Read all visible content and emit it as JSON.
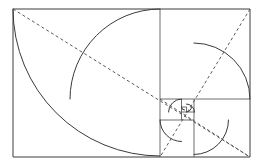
{
  "figure": {
    "title": "Golden Ratio Fibonacci Spiral Diagram",
    "kind": "geometric-line-drawing",
    "canvas": {
      "width": 262,
      "height": 166,
      "background": "#ffffff"
    },
    "colors": {
      "outline": "#3c3c3c",
      "subdivision": "#4a4a4a",
      "spiral": "#3a3a3a",
      "diagonal_dashed": "#5a5a5a"
    },
    "outer_rectangle": {
      "name": "golden-rectangle",
      "x": 13,
      "y": 9,
      "width": 237,
      "height": 148,
      "ratio_label": "1.618"
    },
    "squares": [
      {
        "index": 1,
        "x": 13,
        "y": 9,
        "size": 147.0,
        "corner": "top-left"
      },
      {
        "index": 2,
        "x": 160,
        "y": 9,
        "size": 90.0,
        "corner": "top-right"
      },
      {
        "index": 3,
        "x": 194,
        "y": 99,
        "size": 56.0,
        "corner": "bottom-right"
      },
      {
        "index": 4,
        "x": 160,
        "y": 120,
        "size": 34.5,
        "corner": "bottom-left"
      },
      {
        "index": 5,
        "x": 160,
        "y": 99,
        "size": 21.5,
        "corner": "top-left"
      },
      {
        "index": 6,
        "x": 181.5,
        "y": 99,
        "size": 13.0,
        "corner": "top-right"
      },
      {
        "index": 7,
        "x": 186.5,
        "y": 112,
        "size": 8.0,
        "corner": "bottom-right"
      },
      {
        "index": 8,
        "x": 181.5,
        "y": 107,
        "size": 5.0,
        "corner": "bottom-left"
      },
      {
        "index": 9,
        "x": 181.5,
        "y": 104,
        "size": 3.0,
        "corner": "top-left"
      }
    ],
    "subdivision_lines": [
      {
        "name": "vertical-split-main",
        "x1": 160,
        "y1": 9,
        "x2": 160,
        "y2": 157
      },
      {
        "name": "horizontal-split-right",
        "x1": 160,
        "y1": 99,
        "x2": 250,
        "y2": 99
      },
      {
        "name": "vertical-split-lower",
        "x1": 194,
        "y1": 99,
        "x2": 194,
        "y2": 157
      },
      {
        "name": "horizontal-split-small",
        "x1": 160,
        "y1": 120,
        "x2": 194,
        "y2": 120
      },
      {
        "name": "vertical-split-tiny",
        "x1": 181.5,
        "y1": 99,
        "x2": 181.5,
        "y2": 120
      },
      {
        "name": "horizontal-split-tiny",
        "x1": 181.5,
        "y1": 112,
        "x2": 194.5,
        "y2": 112
      },
      {
        "name": "vertical-split-micro",
        "x1": 186.5,
        "y1": 107,
        "x2": 186.5,
        "y2": 112
      },
      {
        "name": "horizontal-split-micro",
        "x1": 181.5,
        "y1": 107,
        "x2": 186.5,
        "y2": 107
      }
    ],
    "spiral_arcs": [
      {
        "index": 1,
        "center_x": 160,
        "center_y": 9,
        "radius": 147.0,
        "from": "bottom-left-of-square-1",
        "to": "top-left"
      },
      {
        "index": 2,
        "center_x": 160,
        "center_y": 99,
        "radius": 90.0,
        "from": "top-right",
        "to": "right"
      },
      {
        "index": 3,
        "center_x": 194,
        "center_y": 99,
        "radius": 56.0,
        "from": "bottom-right",
        "to": "bottom"
      },
      {
        "index": 4,
        "center_x": 194,
        "center_y": 120,
        "radius": 34.5,
        "from": "bottom-left",
        "to": "left"
      },
      {
        "index": 5,
        "center_x": 181.5,
        "center_y": 120,
        "radius": 21.5,
        "from": "top-left",
        "to": "top"
      },
      {
        "index": 6,
        "center_x": 181.5,
        "center_y": 112,
        "radius": 13.0,
        "from": "top-right",
        "to": "right"
      },
      {
        "index": 7,
        "center_x": 186.5,
        "center_y": 112,
        "radius": 8.0,
        "from": "bottom-right",
        "to": "bottom"
      },
      {
        "index": 8,
        "center_x": 186.5,
        "center_y": 107,
        "radius": 5.0,
        "from": "bottom-left",
        "to": "left"
      },
      {
        "index": 9,
        "center_x": 184.5,
        "center_y": 107,
        "radius": 3.0,
        "from": "top-left",
        "to": "top"
      }
    ],
    "diagonals": [
      {
        "name": "diagonal-main-rect",
        "style": "dashed",
        "x1": 13,
        "y1": 9,
        "x2": 250,
        "y2": 157
      },
      {
        "name": "diagonal-right-upper",
        "style": "dashed",
        "x1": 250,
        "y1": 9,
        "x2": 160,
        "y2": 157
      },
      {
        "name": "diagonal-lower-right",
        "style": "dashed",
        "x1": 160,
        "y1": 99,
        "x2": 250,
        "y2": 157
      }
    ]
  }
}
